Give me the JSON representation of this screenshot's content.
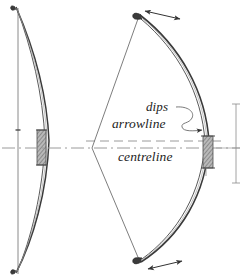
{
  "figure": {
    "kind": "technical-line-drawing",
    "background_color": "#ffffff",
    "ink_color": "#2b2b2b",
    "guide_color": "#9a9a9a",
    "grip_color": "#8d8d8d",
    "width": 242,
    "height": 280
  },
  "labels": {
    "dips": "dips",
    "arrowline": "arrowline",
    "centreline": "centreline"
  },
  "views": {
    "left": {
      "name": "braced-bow-profile",
      "string_style": "straight-vertical",
      "has_grip": true
    },
    "right": {
      "name": "drawn-bow-profile",
      "string_style": "drawn-v-shape",
      "has_grip": true
    }
  },
  "guides": {
    "arrowline_style": "dashed",
    "centreline_style": "dash-dot",
    "arrowline_y": 141,
    "centreline_y": 148
  },
  "annotations": {
    "top_limb_arrow": "double-headed-arrow",
    "bottom_limb_arrow": "double-headed-arrow",
    "dips_leader": "squiggle-leader-arrow",
    "right_dimension": "vertical-dimension-line"
  }
}
